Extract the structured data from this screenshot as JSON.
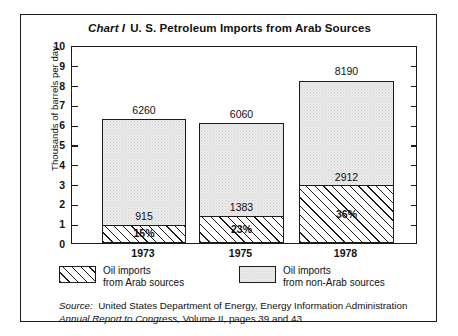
{
  "chart_data": {
    "type": "bar",
    "subtype": "stacked",
    "title_label": "Chart I",
    "title": "U. S. Petroleum Imports from Arab Sources",
    "xlabel": "",
    "ylabel": "Thousands of barrels per day",
    "ylim": [
      0,
      10
    ],
    "yticks": [
      10,
      9,
      8,
      7,
      6,
      5,
      4,
      3,
      2,
      1,
      0
    ],
    "grid": false,
    "legend_position": "below-axes",
    "categories": [
      "1973",
      "1975",
      "1978"
    ],
    "series": [
      {
        "name": "Oil imports from Arab sources",
        "pattern": "diagonal-hatch",
        "values": [
          915,
          1383,
          2912
        ],
        "value_labels": [
          "915",
          "1383",
          "2912"
        ],
        "percent_labels": [
          "15%",
          "23%",
          "36%"
        ]
      },
      {
        "name": "Oil imports from non-Arab sources",
        "pattern": "light-stipple",
        "values": [
          5345,
          4677,
          5278
        ]
      }
    ],
    "totals": [
      6260,
      6060,
      8190
    ],
    "total_labels": [
      "6260",
      "6060",
      "8190"
    ],
    "units_note": "values in thousands of barrels per day",
    "source_line1_label": "Source:",
    "source_line1": "United States Department of Energy, Energy Information Administration",
    "source_line2": "Annual Report to Congress,",
    "source_line2_rest": " Volume II, pages 39 and 43."
  },
  "chart": {
    "title_label": "Chart I",
    "title_text": "U. S. Petroleum Imports from Arab Sources",
    "y_axis_title": "Thousands of barrels per day",
    "y_ticks": [
      "10",
      "9",
      "8",
      "7",
      "6",
      "5",
      "4",
      "3",
      "2",
      "1",
      "0"
    ],
    "bars": [
      {
        "year": "1973",
        "total_label": "6260",
        "arab_value_label": "915",
        "percent_label": "15%"
      },
      {
        "year": "1975",
        "total_label": "6060",
        "arab_value_label": "1383",
        "percent_label": "23%"
      },
      {
        "year": "1978",
        "total_label": "8190",
        "arab_value_label": "2912",
        "percent_label": "36%"
      }
    ],
    "legend": [
      {
        "line1": "Oil imports",
        "line2": "from Arab sources"
      },
      {
        "line1": "Oil imports",
        "line2": "from non-Arab sources"
      }
    ],
    "source": {
      "label": "Source:",
      "line1": "United States Department of Energy, Energy Information Administration",
      "line2_italic": "Annual Report to Congress,",
      "line2_rest": " Volume II, pages 39 and 43."
    }
  },
  "colors": {
    "ink": "#1b1b1b",
    "paper": "#ffffff",
    "stipple": "#ebebeb"
  }
}
